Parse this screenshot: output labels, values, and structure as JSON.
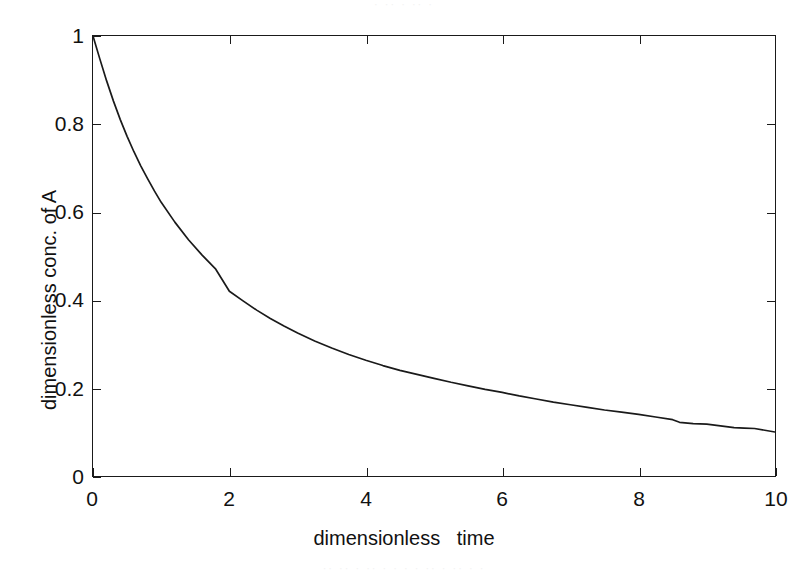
{
  "figure": {
    "background_color": "#ffffff",
    "axis_color": "#1a1a1a",
    "curve_color": "#1a1a1a"
  },
  "scan_artifacts": {
    "top_ghost_text": "·  ·· ·   ··  ·",
    "bottom_ghost_text": "·· ·· ·   ·· ·  ·  ·   ·  ··    ·   ··          · ·"
  },
  "axes": {
    "x_title": "dimensionless   time",
    "y_title": "dimensionless conc. of A",
    "x_ticks": [
      "0",
      "2",
      "4",
      "6",
      "8",
      "10"
    ],
    "y_ticks": [
      "0",
      "0.2",
      "0.4",
      "0.6",
      "0.8",
      "1"
    ]
  },
  "chart_data": {
    "type": "line",
    "title": "",
    "xlabel": "dimensionless   time",
    "ylabel": "dimensionless conc. of A",
    "xlim": [
      0,
      10
    ],
    "ylim": [
      0,
      1
    ],
    "xticks": [
      0,
      2,
      4,
      6,
      8,
      10
    ],
    "yticks": [
      0,
      0.2,
      0.4,
      0.6,
      0.8,
      1
    ],
    "grid": false,
    "legend": false,
    "legend_position": "none",
    "series": [
      {
        "name": "dimensionless conc. of A",
        "color": "#1a1a1a",
        "x": [
          0,
          0.1,
          0.2,
          0.3,
          0.4,
          0.5,
          0.6,
          0.7,
          0.8,
          0.9,
          1.0,
          1.2,
          1.4,
          1.6,
          1.8,
          2.0,
          2.2,
          2.4,
          2.6,
          2.8,
          3.0,
          3.25,
          3.5,
          3.75,
          4.0,
          4.25,
          4.5,
          4.75,
          5.0,
          5.25,
          5.5,
          5.75,
          6.0,
          6.25,
          6.5,
          6.75,
          7.0,
          7.25,
          7.5,
          7.75,
          8.0,
          8.25,
          8.5,
          8.6,
          8.8,
          9.0,
          9.2,
          9.4,
          9.55,
          9.7,
          9.85,
          10.0
        ],
        "y": [
          1.0,
          0.948,
          0.898,
          0.852,
          0.81,
          0.772,
          0.737,
          0.705,
          0.676,
          0.648,
          0.622,
          0.577,
          0.537,
          0.502,
          0.47,
          0.42,
          0.398,
          0.377,
          0.358,
          0.341,
          0.325,
          0.307,
          0.291,
          0.276,
          0.263,
          0.251,
          0.24,
          0.231,
          0.222,
          0.213,
          0.205,
          0.197,
          0.19,
          0.182,
          0.175,
          0.168,
          0.162,
          0.156,
          0.15,
          0.145,
          0.14,
          0.134,
          0.128,
          0.122,
          0.119,
          0.118,
          0.114,
          0.11,
          0.109,
          0.108,
          0.104,
          0.1
        ]
      }
    ],
    "annotations": []
  }
}
